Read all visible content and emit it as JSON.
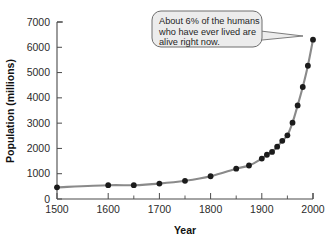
{
  "chart_data": {
    "type": "line",
    "title": "",
    "xlabel": "Year",
    "ylabel": "Population (millions)",
    "xlim": [
      1500,
      2000
    ],
    "ylim": [
      0,
      7000
    ],
    "grid": false,
    "legend": "none",
    "marker": "filled-circle",
    "line_color": "#8a8a8a",
    "marker_color": "#1b1b1b",
    "x_ticks_major": [
      1500,
      1600,
      1700,
      1800,
      1900,
      2000
    ],
    "x_ticks_minor": [
      1650,
      1750,
      1850,
      1950
    ],
    "x_tick_labels": [
      "1500",
      "1600",
      "1700",
      "1800",
      "1900",
      "2000"
    ],
    "y_ticks": [
      0,
      1000,
      2000,
      3000,
      4000,
      5000,
      6000,
      7000
    ],
    "y_tick_labels": [
      "0",
      "1000",
      "2000",
      "3000",
      "4000",
      "5000",
      "6000",
      "7000"
    ],
    "x": [
      1500,
      1600,
      1650,
      1700,
      1750,
      1800,
      1850,
      1875,
      1900,
      1910,
      1920,
      1930,
      1940,
      1950,
      1960,
      1970,
      1980,
      1990,
      2000
    ],
    "y": [
      460,
      545,
      545,
      610,
      720,
      900,
      1200,
      1325,
      1600,
      1750,
      1860,
      2070,
      2300,
      2520,
      3020,
      3700,
      4430,
      5270,
      6300
    ],
    "series": [
      {
        "name": "World population",
        "values": [
          460,
          545,
          545,
          610,
          720,
          900,
          1200,
          1325,
          1600,
          1750,
          1860,
          2070,
          2300,
          2520,
          3020,
          3700,
          4430,
          5270,
          6300
        ]
      }
    ],
    "annotations": [
      {
        "name": "callout",
        "lines": [
          "About 6% of the humans",
          "who have ever lived are",
          "alive right now."
        ],
        "text": "About 6% of the humans who have ever lived are alive right now.",
        "points_to_x": 2000,
        "points_to_y": 6300
      }
    ]
  },
  "axes": {
    "x_title": "Year",
    "y_title": "Population (millions)"
  },
  "callout": {
    "line1": "About 6% of the humans",
    "line2": "who have ever lived are",
    "line3": "alive right now.",
    "fill": "#ececec",
    "stroke": "#6e6e6e"
  },
  "colors": {
    "background": "#ffffff",
    "axis": "#4a4a4a",
    "line": "#8a8a8a",
    "marker": "#1b1b1b",
    "text": "#1f1f1f"
  }
}
